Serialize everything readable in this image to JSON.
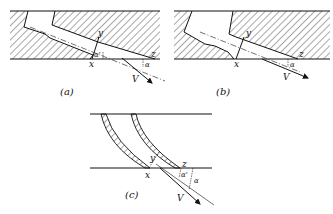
{
  "figure": {
    "panels": [
      {
        "id": "a",
        "caption": "(a)",
        "labels": {
          "x": "x",
          "y": "y",
          "z": "z",
          "alpha_inner": "α'",
          "alpha": "α",
          "velocity": "V"
        }
      },
      {
        "id": "b",
        "caption": "(b)",
        "labels": {
          "x": "x",
          "y": "y",
          "z": "z",
          "alpha": "α",
          "velocity": "V"
        }
      },
      {
        "id": "c",
        "caption": "(c)",
        "labels": {
          "x": "x",
          "y": "y",
          "z": "z",
          "alpha_inner": "α'",
          "alpha": "α",
          "velocity": "V"
        }
      }
    ],
    "colors": {
      "line": "#111111",
      "background": "#ffffff"
    }
  }
}
